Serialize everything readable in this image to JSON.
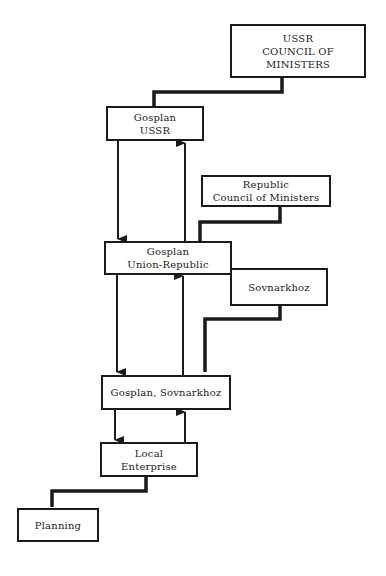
{
  "diagram": {
    "type": "hierarchy-flow",
    "nodes": [
      {
        "id": "ussr-council",
        "lines": [
          "USSR",
          "COUNCIL OF MINISTERS"
        ]
      },
      {
        "id": "gosplan-ussr",
        "lines": [
          "Gosplan",
          "USSR"
        ]
      },
      {
        "id": "republic-council",
        "lines": [
          "Republic",
          "Council of Ministers"
        ]
      },
      {
        "id": "gosplan-union-republic",
        "lines": [
          "Gosplan",
          "Union-Republic"
        ]
      },
      {
        "id": "sovnarkhoz",
        "lines": [
          "Sovnarkhoz"
        ]
      },
      {
        "id": "gosplan-sovnarkhoz",
        "lines": [
          "Gosplan, Sovnarkhoz"
        ]
      },
      {
        "id": "local-enterprise",
        "lines": [
          "Local",
          "Enterprise"
        ]
      },
      {
        "id": "planning",
        "lines": [
          "Planning"
        ]
      }
    ],
    "edges": [
      {
        "from": "ussr-council",
        "to": "gosplan-ussr",
        "style": "thick-stepped"
      },
      {
        "from": "gosplan-ussr",
        "to": "gosplan-union-republic",
        "style": "arrow-down"
      },
      {
        "from": "gosplan-union-republic",
        "to": "gosplan-ussr",
        "style": "arrow-up"
      },
      {
        "from": "republic-council",
        "to": "gosplan-union-republic",
        "style": "thick-stepped"
      },
      {
        "from": "gosplan-union-republic",
        "to": "gosplan-sovnarkhoz",
        "style": "arrow-down"
      },
      {
        "from": "gosplan-sovnarkhoz",
        "to": "gosplan-union-republic",
        "style": "arrow-up"
      },
      {
        "from": "sovnarkhoz",
        "to": "gosplan-sovnarkhoz",
        "style": "thick-stepped"
      },
      {
        "from": "gosplan-sovnarkhoz",
        "to": "local-enterprise",
        "style": "arrow-down"
      },
      {
        "from": "local-enterprise",
        "to": "gosplan-sovnarkhoz",
        "style": "arrow-up"
      },
      {
        "from": "local-enterprise",
        "to": "planning",
        "style": "thick-stepped"
      }
    ]
  }
}
